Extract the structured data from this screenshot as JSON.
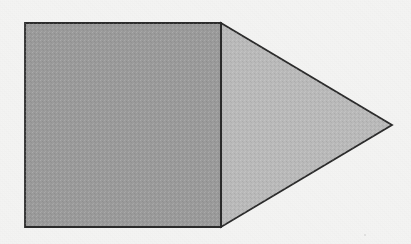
{
  "figure": {
    "canvas": {
      "width": 411,
      "height": 244
    },
    "background_color": "#f4f4f3",
    "stroke_color": "#2b2b2b",
    "stroke_width": 1.8,
    "shapes": [
      {
        "id": "square",
        "name": "shaded-square",
        "type": "rectangle",
        "fill_color": "#9a9a9a",
        "points": "25,23 221,23 221,227 25,227",
        "x": 25,
        "y": 23,
        "width": 196,
        "height": 204
      },
      {
        "id": "triangle",
        "name": "shaded-triangle",
        "type": "triangle",
        "fill_color": "#b9b9b9",
        "points": "221,23 392,125 221,227",
        "apex_x": 392,
        "apex_y": 125,
        "base_top_x": 221,
        "base_top_y": 23,
        "base_bottom_x": 221,
        "base_bottom_y": 227
      }
    ],
    "shared_edge": {
      "name": "shared-vertical-edge",
      "x": 221,
      "y1": 23,
      "y2": 227
    },
    "specks": [
      {
        "x": 364,
        "y": 234
      }
    ]
  }
}
